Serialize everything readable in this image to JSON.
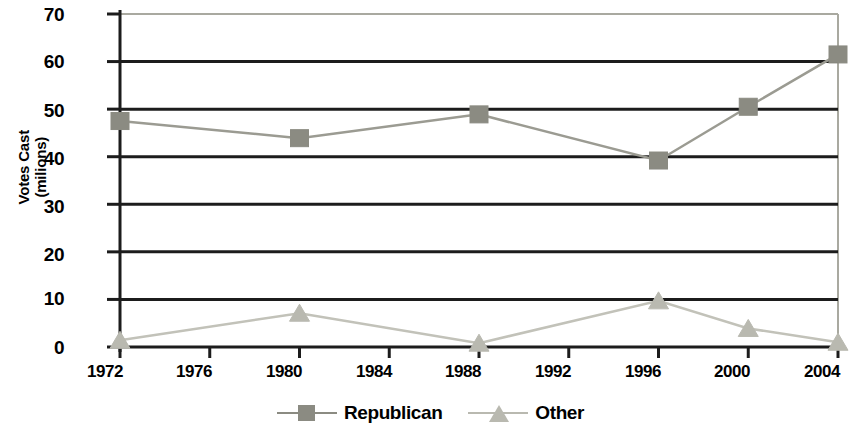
{
  "chart_data": {
    "type": "line",
    "title": "",
    "xlabel": "",
    "ylabel": "Votes Cast\n(milions)",
    "categories": [
      "1972",
      "1976",
      "1980",
      "1984",
      "1988",
      "1992",
      "1996",
      "2000",
      "2004"
    ],
    "x_values": [
      1972,
      1980,
      1988,
      1996,
      2000,
      2004
    ],
    "ylim": [
      0,
      70
    ],
    "y_ticks": [
      "0",
      "10",
      "20",
      "30",
      "40",
      "50",
      "60",
      "70"
    ],
    "y_tick_values": [
      0,
      10,
      20,
      30,
      40,
      50,
      60,
      70
    ],
    "grid": "horizontal",
    "legend_position": "bottom-center",
    "series": [
      {
        "name": "Republican",
        "marker": "square",
        "color": "#8b8b82",
        "line_color": "#9b9b92",
        "points": [
          {
            "x": "1972",
            "y": 47.5
          },
          {
            "x": "1980",
            "y": 43.9
          },
          {
            "x": "1988",
            "y": 48.9
          },
          {
            "x": "1996",
            "y": 39.2
          },
          {
            "x": "2000",
            "y": 50.5
          },
          {
            "x": "2004",
            "y": 61.5
          }
        ]
      },
      {
        "name": "Other",
        "marker": "triangle",
        "color": "#b9b9b0",
        "line_color": "#c2c2b9",
        "points": [
          {
            "x": "1972",
            "y": 1.4
          },
          {
            "x": "1980",
            "y": 7.1
          },
          {
            "x": "1988",
            "y": 0.8
          },
          {
            "x": "1996",
            "y": 9.7
          },
          {
            "x": "2000",
            "y": 3.9
          },
          {
            "x": "2004",
            "y": 1.0
          }
        ]
      }
    ]
  },
  "axis": {
    "y_title": "Votes Cast\n(milions)",
    "y_ticks": [
      "70",
      "60",
      "50",
      "40",
      "30",
      "20",
      "10",
      "0"
    ],
    "x_ticks": [
      "1972",
      "1976",
      "1980",
      "1984",
      "1988",
      "1992",
      "1996",
      "2000",
      "2004"
    ]
  },
  "legend": {
    "items": [
      {
        "label": "Republican",
        "marker": "square-marker",
        "color": "#8b8b82"
      },
      {
        "label": "Other",
        "marker": "triangle-marker",
        "color": "#b9b9b0"
      }
    ]
  },
  "colors": {
    "republican": "#8b8b82",
    "other": "#b9b9b0",
    "gridline": "#1c1c1c",
    "frame": "#a9a9a0",
    "axis": "#1c1c1c",
    "text": "#000000",
    "background": "#ffffff"
  }
}
